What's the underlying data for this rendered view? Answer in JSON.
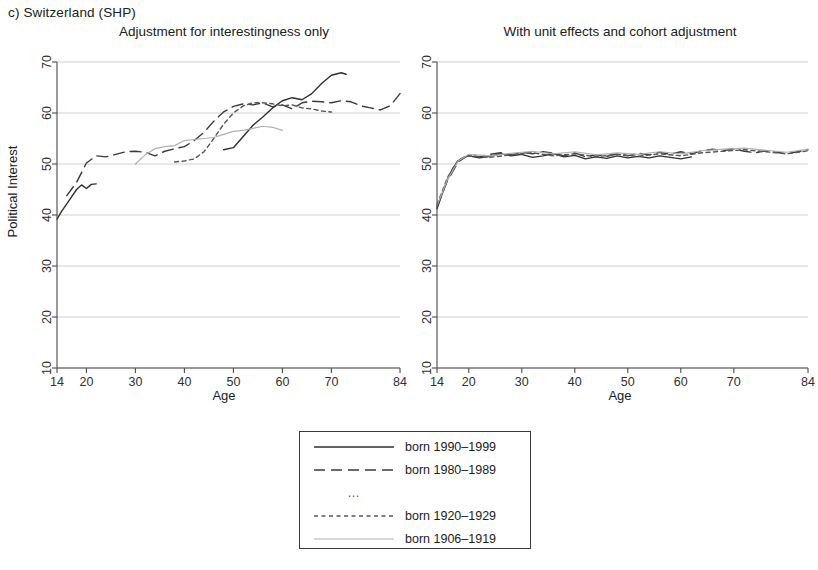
{
  "figure": {
    "caption": "c) Switzerland (SHP)"
  },
  "panels": [
    {
      "id": "left",
      "title": "Adjustment for interestingness only",
      "xlabel": "Age",
      "ylabel": "Political Interest"
    },
    {
      "id": "right",
      "title": "With unit effects and cohort adjustment",
      "xlabel": "Age",
      "ylabel": ""
    }
  ],
  "axes": {
    "y_ticks": [
      10,
      20,
      30,
      40,
      50,
      60,
      70
    ],
    "y_tick_labels": [
      "10",
      "20",
      "30",
      "40",
      "50",
      "60",
      "70"
    ],
    "ylim": [
      10,
      70
    ],
    "x_ticks": [
      14,
      20,
      30,
      40,
      50,
      60,
      70,
      84
    ],
    "x_tick_labels": [
      "14",
      "20",
      "30",
      "40",
      "50",
      "60",
      "70",
      "84"
    ],
    "xlim": [
      14,
      84
    ],
    "grid": "horizontal"
  },
  "legend": {
    "position": "below-center",
    "entries": [
      {
        "label": "born 1990–1999",
        "style": "solid",
        "color": "#2f2f2f",
        "width": 1.5
      },
      {
        "label": "born 1980–1989",
        "style": "long-dash",
        "color": "#3a3a3a",
        "width": 1.5
      },
      {
        "label": "…",
        "style": "ellipsis",
        "color": "#666666",
        "width": 0
      },
      {
        "label": "born 1920–1929",
        "style": "short-dash",
        "color": "#555555",
        "width": 1.3
      },
      {
        "label": "born 1906–1919",
        "style": "solid-light",
        "color": "#b0b0b0",
        "width": 1.3
      }
    ]
  },
  "chart_data": {
    "type": "line",
    "title": "c) Switzerland (SHP)",
    "xlabel": "Age",
    "ylabel": "Political Interest",
    "xlim": [
      14,
      84
    ],
    "ylim": [
      10,
      70
    ],
    "grid": true,
    "legend_position": "below-center",
    "panels": [
      {
        "name": "Adjustment for interestingness only",
        "series": [
          {
            "name": "born 1990–1999",
            "style": "solid",
            "color": "#2f2f2f",
            "x": [
              14,
              15,
              16,
              17,
              18,
              19,
              20,
              21,
              22
            ],
            "y": [
              39.2,
              40.8,
              42.2,
              43.6,
              45.0,
              45.9,
              45.2,
              46.0,
              46.1
            ]
          },
          {
            "name": "born 1980–1989 (upper dark solid continuation)",
            "style": "solid",
            "color": "#2f2f2f",
            "x": [
              48,
              50,
              52,
              54,
              56,
              58,
              60,
              62,
              64,
              66,
              68,
              70,
              72,
              73
            ],
            "y": [
              52.8,
              53.2,
              55.4,
              57.6,
              59.2,
              61.0,
              62.4,
              63.0,
              62.6,
              63.8,
              65.8,
              67.4,
              67.9,
              67.6
            ]
          },
          {
            "name": "born 1980–1989",
            "style": "long-dash",
            "color": "#3a3a3a",
            "x": [
              16,
              18,
              20,
              22,
              24,
              26,
              28,
              30,
              32,
              34,
              36,
              38,
              40,
              42,
              44,
              46,
              48,
              50,
              52,
              54,
              56,
              58,
              60,
              62,
              64,
              66,
              68,
              70,
              72,
              74,
              76,
              78,
              80,
              82,
              84
            ],
            "y": [
              43.8,
              46.4,
              50.2,
              51.6,
              51.4,
              51.9,
              52.4,
              52.5,
              52.3,
              51.6,
              52.5,
              53.0,
              53.4,
              54.6,
              56.2,
              58.4,
              60.2,
              61.3,
              61.8,
              61.6,
              62.0,
              61.2,
              61.6,
              60.8,
              62.0,
              62.3,
              62.2,
              62.0,
              62.4,
              62.2,
              61.4,
              61.0,
              60.6,
              61.4,
              63.8
            ]
          },
          {
            "name": "born 1920–1929",
            "style": "short-dash",
            "color": "#555555",
            "x": [
              38,
              40,
              42,
              44,
              46,
              48,
              50,
              52,
              54,
              56,
              58,
              60,
              62,
              64,
              66,
              68,
              70
            ],
            "y": [
              50.4,
              50.6,
              51.0,
              52.4,
              55.0,
              57.8,
              60.0,
              61.4,
              62.0,
              62.0,
              61.8,
              61.4,
              61.6,
              61.0,
              60.8,
              60.4,
              60.2
            ]
          },
          {
            "name": "born 1906–1919",
            "style": "solid-light",
            "color": "#b0b0b0",
            "x": [
              30,
              32,
              34,
              36,
              38,
              40,
              42,
              44,
              46,
              48,
              50,
              52,
              54,
              56,
              58,
              60
            ],
            "y": [
              50.0,
              51.8,
              53.0,
              53.4,
              53.6,
              54.6,
              54.8,
              55.0,
              55.2,
              55.8,
              56.4,
              56.6,
              57.0,
              57.4,
              57.2,
              56.6
            ]
          }
        ]
      },
      {
        "name": "With unit effects and cohort adjustment",
        "series": [
          {
            "name": "born 1990–1999",
            "style": "solid",
            "color": "#2f2f2f",
            "x": [
              14,
              15,
              16,
              17,
              18,
              19,
              20,
              22,
              24,
              26,
              28,
              30,
              32,
              34,
              36,
              38,
              40,
              42,
              44,
              46,
              48,
              50,
              52,
              54,
              56,
              58,
              60,
              62
            ],
            "y": [
              41.2,
              44.2,
              47.0,
              49.2,
              50.6,
              51.3,
              51.6,
              51.2,
              51.5,
              52.0,
              51.6,
              51.9,
              51.3,
              51.6,
              52.0,
              51.4,
              51.7,
              51.0,
              51.4,
              51.1,
              51.6,
              51.2,
              51.5,
              51.2,
              51.6,
              51.3,
              51.0,
              51.4
            ]
          },
          {
            "name": "born 1980–1989",
            "style": "long-dash",
            "color": "#3a3a3a",
            "x": [
              14,
              16,
              18,
              20,
              22,
              24,
              26,
              28,
              30,
              32,
              34,
              36,
              38,
              40,
              42,
              44,
              46,
              48,
              50,
              52,
              54,
              56,
              58,
              60,
              62,
              64,
              66,
              68,
              70,
              72,
              74,
              76,
              78,
              80,
              82,
              84
            ],
            "y": [
              41.6,
              46.8,
              50.4,
              51.8,
              51.4,
              51.9,
              52.2,
              51.8,
              52.3,
              52.0,
              52.4,
              52.1,
              51.6,
              52.2,
              51.4,
              51.8,
              51.5,
              52.0,
              51.6,
              52.1,
              51.8,
              52.3,
              51.9,
              52.4,
              52.0,
              52.6,
              52.9,
              52.6,
              53.0,
              52.5,
              52.2,
              52.6,
              52.3,
              52.0,
              52.4,
              52.8
            ]
          },
          {
            "name": "born 1920–1929",
            "style": "short-dash",
            "color": "#555555",
            "x": [
              14,
              16,
              18,
              20,
              24,
              28,
              32,
              36,
              40,
              44,
              48,
              52,
              56,
              60,
              64,
              68,
              72,
              76,
              80,
              84
            ],
            "y": [
              42.0,
              47.4,
              50.8,
              51.6,
              51.3,
              51.8,
              52.2,
              51.6,
              52.0,
              51.4,
              51.9,
              51.5,
              52.0,
              51.6,
              52.2,
              52.5,
              52.8,
              52.4,
              52.0,
              52.6
            ]
          },
          {
            "name": "born 1906–1919",
            "style": "solid-light",
            "color": "#b0b0b0",
            "x": [
              14,
              16,
              18,
              20,
              24,
              28,
              32,
              36,
              40,
              44,
              48,
              52,
              56,
              60,
              64,
              68,
              72,
              76,
              80,
              84
            ],
            "y": [
              41.8,
              47.0,
              50.6,
              51.9,
              51.6,
              52.1,
              52.5,
              52.0,
              52.4,
              51.8,
              52.2,
              51.9,
              52.4,
              52.0,
              52.6,
              52.9,
              53.1,
              52.7,
              52.3,
              52.9
            ]
          }
        ]
      }
    ]
  }
}
